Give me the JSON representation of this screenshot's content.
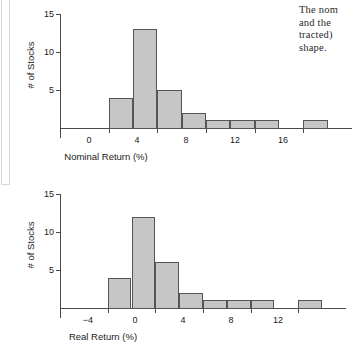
{
  "page": {
    "background": "#ffffff",
    "bar_fill": "#c6c6c6",
    "bar_stroke": "#555555",
    "axis_color": "#4a4a4a"
  },
  "body_text": {
    "name": "cut-off-paragraph",
    "lines": [
      "The nom",
      "and  the",
      "tracted)",
      "shape."
    ]
  },
  "chart_data": [
    {
      "id": "nominal-return-histogram",
      "type": "bar",
      "title": "",
      "xlabel": "Nominal Return (%)",
      "ylabel": "# of Stocks",
      "xlim": [
        -4,
        20
      ],
      "ylim": [
        0,
        15
      ],
      "xticks": [
        0,
        4,
        8,
        12,
        16
      ],
      "yticks": [
        5,
        10,
        15
      ],
      "bin_width": 2,
      "grid": false,
      "legend": null,
      "bins": [
        {
          "start": 0,
          "end": 2,
          "value": 4
        },
        {
          "start": 2,
          "end": 4,
          "value": 13
        },
        {
          "start": 4,
          "end": 6,
          "value": 5
        },
        {
          "start": 6,
          "end": 8,
          "value": 2
        },
        {
          "start": 8,
          "end": 10,
          "value": 1
        },
        {
          "start": 10,
          "end": 12,
          "value": 1
        },
        {
          "start": 12,
          "end": 14,
          "value": 1
        },
        {
          "start": 14,
          "end": 16,
          "value": 0
        },
        {
          "start": 16,
          "end": 18,
          "value": 1
        }
      ],
      "categories": [
        "0-2",
        "2-4",
        "4-6",
        "6-8",
        "8-10",
        "10-12",
        "12-14",
        "14-16",
        "16-18"
      ],
      "values": [
        4,
        13,
        5,
        2,
        1,
        1,
        1,
        0,
        1
      ]
    },
    {
      "id": "real-return-histogram",
      "type": "bar",
      "title": "",
      "xlabel": "Real Return (%)",
      "ylabel": "# of Stocks",
      "xlim": [
        -8,
        16
      ],
      "ylim": [
        0,
        15
      ],
      "xticks": [
        -4,
        0,
        4,
        8,
        12
      ],
      "yticks": [
        5,
        10,
        15
      ],
      "bin_width": 2,
      "grid": false,
      "legend": null,
      "bins": [
        {
          "start": -4,
          "end": -2,
          "value": 4
        },
        {
          "start": -2,
          "end": 0,
          "value": 12
        },
        {
          "start": 0,
          "end": 2,
          "value": 6
        },
        {
          "start": 2,
          "end": 4,
          "value": 2
        },
        {
          "start": 4,
          "end": 6,
          "value": 1
        },
        {
          "start": 6,
          "end": 8,
          "value": 1
        },
        {
          "start": 8,
          "end": 10,
          "value": 1
        },
        {
          "start": 10,
          "end": 12,
          "value": 0
        },
        {
          "start": 12,
          "end": 14,
          "value": 1
        }
      ],
      "categories": [
        "-4--2",
        "-2-0",
        "0-2",
        "2-4",
        "4-6",
        "6-8",
        "8-10",
        "10-12",
        "12-14"
      ],
      "values": [
        4,
        12,
        6,
        2,
        1,
        1,
        1,
        0,
        1
      ]
    }
  ]
}
